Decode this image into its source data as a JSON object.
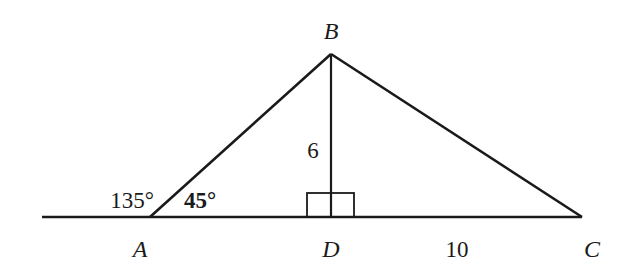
{
  "diagram": {
    "type": "geometry-triangle",
    "stroke_color": "#1a1a1a",
    "background": "#ffffff",
    "points": {
      "A": {
        "label": "A",
        "x": 150,
        "y": 217
      },
      "B": {
        "label": "B",
        "x": 331,
        "y": 54
      },
      "C": {
        "label": "C",
        "x": 582,
        "y": 217
      },
      "D": {
        "label": "D",
        "x": 331,
        "y": 217
      }
    },
    "baseline": {
      "x1": 42,
      "y1": 217,
      "x2": 582,
      "y2": 217
    },
    "segments": [
      {
        "from": "A",
        "to": "B"
      },
      {
        "from": "B",
        "to": "C"
      },
      {
        "from": "B",
        "to": "D"
      },
      {
        "from": "A",
        "to": "C"
      }
    ],
    "right_angle_marker": {
      "at": "D",
      "x": 307,
      "y": 193,
      "width": 47,
      "height": 24
    },
    "labels": {
      "vertex_A": "A",
      "vertex_B": "B",
      "vertex_C": "C",
      "vertex_D": "D",
      "height_BD": "6",
      "length_DC": "10",
      "exterior_angle_A": "135°",
      "interior_angle_A": "45°"
    }
  }
}
